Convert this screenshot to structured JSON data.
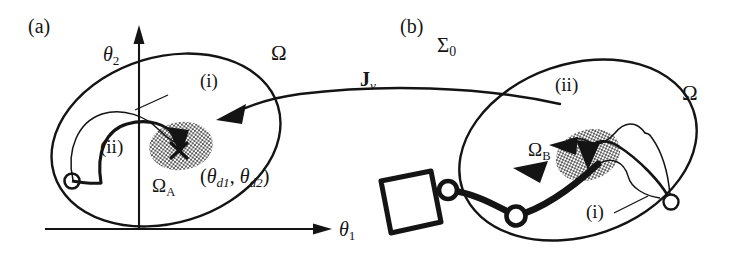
{
  "figure": {
    "background_color": "#ffffff",
    "ink_color": "#141414",
    "panels": [
      {
        "tag": "(a)",
        "space": "joint space",
        "axes": {
          "x_label": "θ",
          "x_sub": "1",
          "y_label": "θ",
          "y_sub": "2"
        },
        "region_label": "Ω",
        "target_region_label": "Ω",
        "target_region_sub": "A",
        "desired_point_label": "(θ",
        "desired_point_text": "(θd1, θd2)",
        "trajectory_labels": [
          "(i)",
          "(ii)"
        ]
      },
      {
        "tag": "(b)",
        "space": "task space",
        "frame_label": "Σ",
        "frame_sub": "0",
        "region_label": "Ω",
        "target_region_label": "Ω",
        "target_region_sub": "B",
        "trajectory_labels": [
          "(i)",
          "(ii)"
        ]
      }
    ],
    "mapping": {
      "label": "J",
      "sub": "v",
      "direction": "right-to-left",
      "description": "velocity Jacobian mapping arrow"
    },
    "labels": {
      "panel_a_tag": "(a)",
      "panel_b_tag": "(b)",
      "theta_1": "θ",
      "theta_1_sub": "1",
      "theta_2": "θ",
      "theta_2_sub": "2",
      "omega_a_region": "Ω",
      "omega_left": "Ω",
      "omega_right": "Ω",
      "omega_a_sub": "A",
      "omega_b_sub": "B",
      "sigma": "Σ",
      "sigma_sub": "0",
      "jacobian": "J",
      "jacobian_sub": "v",
      "traj_i_left": "(i)",
      "traj_ii_left": "(ii)",
      "traj_i_right": "(i)",
      "traj_ii_right": "(ii)",
      "desired_open": "(",
      "desired_theta": "θ",
      "desired_sub_1": "d1",
      "desired_comma": ", ",
      "desired_theta_2": "θ",
      "desired_sub_2": "d2",
      "desired_close": ")"
    },
    "manipulator": {
      "links": 2,
      "joints": 3,
      "payload_shape": "square"
    }
  }
}
